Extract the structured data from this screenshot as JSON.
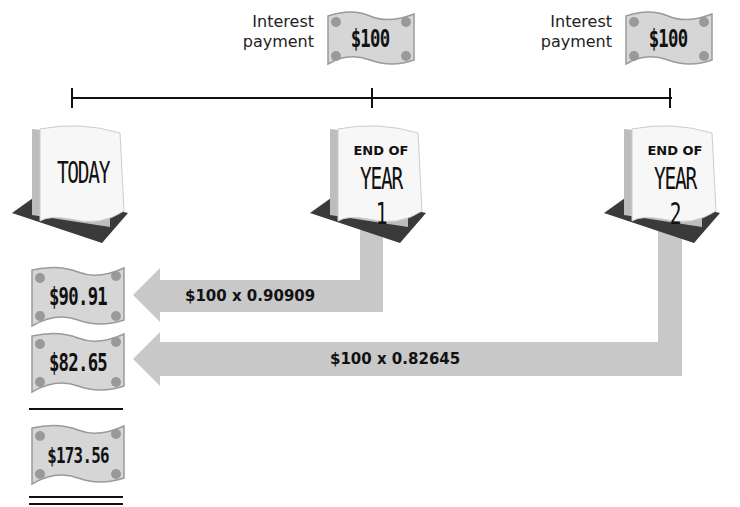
{
  "timeline": {
    "points": [
      {
        "label_top": "",
        "label_main": "TODAY"
      },
      {
        "label_top": "END OF",
        "label_main": "YEAR 1"
      },
      {
        "label_top": "END OF",
        "label_main": "YEAR 2"
      }
    ]
  },
  "payments": [
    {
      "caption_line1": "Interest",
      "caption_line2": "payment",
      "amount": "$100"
    },
    {
      "caption_line1": "Interest",
      "caption_line2": "payment",
      "amount": "$100"
    }
  ],
  "discounts": [
    {
      "formula": "$100 x 0.90909",
      "present_value": "$90.91"
    },
    {
      "formula": "$100 x 0.82645",
      "present_value": "$82.65"
    }
  ],
  "total": {
    "present_value": "$173.56"
  },
  "colors": {
    "arrow": "#c8c8c8",
    "line": "#111111",
    "bill": "#d9d9d9",
    "calendar_base": "#3a3a3a"
  }
}
